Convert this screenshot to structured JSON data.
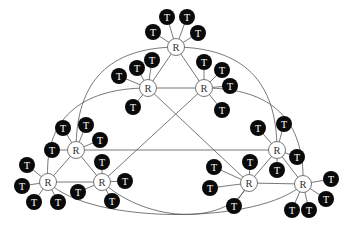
{
  "diagram": {
    "type": "network-topology",
    "style": {
      "edge_color": "#555555",
      "router_fill": "#ffffff",
      "router_stroke": "#666666",
      "router_text": "#333333",
      "terminal_fill": "#0a0a0a",
      "terminal_text": "#ffffff"
    },
    "labels": {
      "router": "R",
      "terminal": "T"
    },
    "routers": [
      {
        "id": "R1",
        "x": 176,
        "y": 47,
        "label": "R",
        "terminals": [
          [
            153,
            32
          ],
          [
            167,
            17
          ],
          [
            187,
            17
          ],
          [
            198,
            33
          ]
        ]
      },
      {
        "id": "R2",
        "x": 148,
        "y": 88,
        "label": "R",
        "terminals": [
          [
            119,
            76
          ],
          [
            137,
            68
          ],
          [
            152,
            60
          ],
          [
            133,
            107
          ]
        ]
      },
      {
        "id": "R3",
        "x": 204,
        "y": 88,
        "label": "R",
        "terminals": [
          [
            204,
            62
          ],
          [
            222,
            70
          ],
          [
            230,
            86
          ],
          [
            222,
            110
          ]
        ]
      },
      {
        "id": "R4",
        "x": 76,
        "y": 150,
        "label": "R",
        "terminals": [
          [
            63,
            128
          ],
          [
            86,
            125
          ],
          [
            100,
            140
          ],
          [
            52,
            150
          ]
        ]
      },
      {
        "id": "R5",
        "x": 48,
        "y": 182,
        "label": "R",
        "terminals": [
          [
            27,
            165
          ],
          [
            22,
            186
          ],
          [
            34,
            202
          ],
          [
            58,
            202
          ]
        ]
      },
      {
        "id": "R6",
        "x": 102,
        "y": 182,
        "label": "R",
        "terminals": [
          [
            102,
            162
          ],
          [
            125,
            181
          ],
          [
            78,
            192
          ],
          [
            112,
            201
          ]
        ]
      },
      {
        "id": "R7",
        "x": 277,
        "y": 150,
        "label": "R",
        "terminals": [
          [
            258,
            128
          ],
          [
            284,
            124
          ],
          [
            297,
            157
          ],
          [
            277,
            170
          ]
        ]
      },
      {
        "id": "R8",
        "x": 249,
        "y": 183,
        "label": "R",
        "terminals": [
          [
            214,
            167
          ],
          [
            250,
            162
          ],
          [
            210,
            188
          ],
          [
            234,
            206
          ]
        ]
      },
      {
        "id": "R9",
        "x": 303,
        "y": 184,
        "label": "R",
        "terminals": [
          [
            331,
            179
          ],
          [
            326,
            199
          ],
          [
            292,
            210
          ],
          [
            309,
            210
          ]
        ]
      }
    ],
    "edges": [
      {
        "from": "R1",
        "to": "R2",
        "kind": "line"
      },
      {
        "from": "R1",
        "to": "R3",
        "kind": "line"
      },
      {
        "from": "R2",
        "to": "R3",
        "kind": "line"
      },
      {
        "from": "R4",
        "to": "R5",
        "kind": "line"
      },
      {
        "from": "R4",
        "to": "R6",
        "kind": "line"
      },
      {
        "from": "R5",
        "to": "R6",
        "kind": "line"
      },
      {
        "from": "R7",
        "to": "R8",
        "kind": "line"
      },
      {
        "from": "R7",
        "to": "R9",
        "kind": "line"
      },
      {
        "from": "R8",
        "to": "R9",
        "kind": "line"
      },
      {
        "from": "R4",
        "to": "R7",
        "kind": "line"
      },
      {
        "from": "R2",
        "to": "R8",
        "kind": "line"
      },
      {
        "from": "R3",
        "to": "R6",
        "kind": "line"
      },
      {
        "from": "R1",
        "to": "R4",
        "kind": "curve",
        "path": "M176,47 C110,48 76,80 76,150"
      },
      {
        "from": "R2",
        "to": "R5",
        "kind": "curve",
        "path": "M148,88 C80,88 43,120 48,182"
      },
      {
        "from": "R1",
        "to": "R7",
        "kind": "curve",
        "path": "M176,47 C242,48 277,80 277,150"
      },
      {
        "from": "R3",
        "to": "R9",
        "kind": "curve",
        "path": "M204,88 C272,88 305,120 303,184"
      },
      {
        "from": "R5",
        "to": "R9",
        "kind": "curve",
        "path": "M48,182 C90,225 260,225 303,184"
      },
      {
        "from": "R6",
        "to": "R8",
        "kind": "curve",
        "path": "M102,182 C150,225 230,225 249,183"
      }
    ]
  }
}
